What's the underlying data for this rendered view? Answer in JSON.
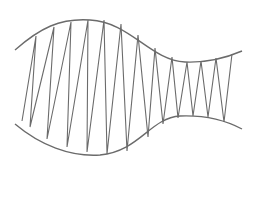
{
  "diagram": {
    "stroke_color": "#6b6b6b",
    "background": "#ffffff",
    "top_curve": "M15,50 C40,28 60,18 90,20 C130,22 150,60 185,62 C210,63 228,57 242,51",
    "bottom_curve": "M15,124 C40,145 70,157 100,155 C140,151 150,118 180,116 C205,115 225,120 242,129",
    "zigzag_points": "22,121 36,36 30,127 54,27 47,139 71,22 67,147 88,20 87,152 104,20 107,154 121,24 127,151 138,35 148,137 155,48 163,124 172,57 178,118 187,62 193,116 201,61 208,117 216,58 224,122 232,54"
  }
}
